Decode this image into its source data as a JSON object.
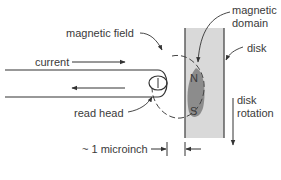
{
  "diagram": {
    "labels": {
      "magnetic_field": "magnetic field",
      "magnetic_domain_line1": "magnetic",
      "magnetic_domain_line2": "domain",
      "disk": "disk",
      "current": "current",
      "read_head": "read head",
      "disk_rotation_line1": "disk",
      "disk_rotation_line2": "rotation",
      "gap": "~ 1 microinch",
      "pole_north": "N",
      "pole_south": "S"
    },
    "colors": {
      "disk_fill": "#d9d9d9",
      "disk_edge": "#555555",
      "domain_fill": "#8c8c8c",
      "line": "#333333",
      "text": "#3a3a3a"
    }
  }
}
